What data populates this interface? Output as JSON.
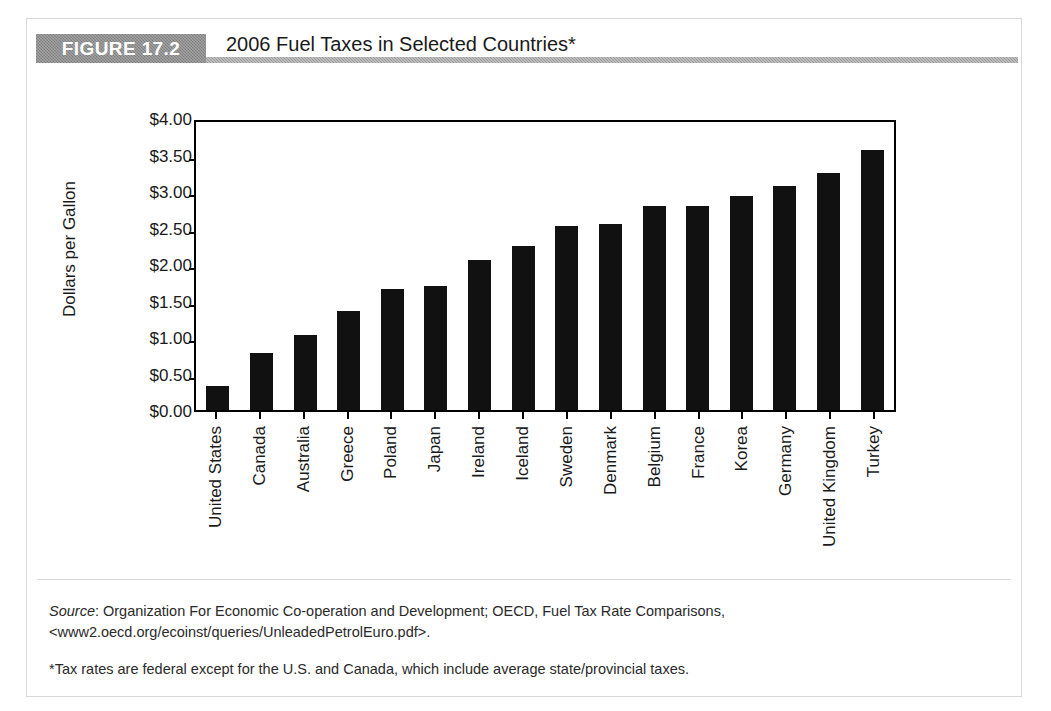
{
  "figure": {
    "badge_label": "FIGURE 17.2",
    "title": "2006 Fuel Taxes in Selected Countries*"
  },
  "notes": {
    "source_label": "Source",
    "source_text": ": Organization For Economic Co-operation and Development; OECD, Fuel Tax Rate Comparisons, <www2.oecd.org/ecoinst/queries/UnleadedPetrolEuro.pdf>.",
    "footnote": "*Tax rates are federal except for the U.S. and Canada, which include average state/provincial taxes."
  },
  "chart_data": {
    "type": "bar",
    "title": "2006 Fuel Taxes in Selected Countries*",
    "xlabel": "",
    "ylabel": "Dollars per Gallon",
    "ylim": [
      0,
      4.0
    ],
    "ytick_step": 0.5,
    "ytick_labels": [
      "$4.00",
      "$3.50",
      "$3.00",
      "$2.50",
      "$2.00",
      "$1.50",
      "$1.00",
      "$0.50",
      "$0.00"
    ],
    "ytick_values": [
      4.0,
      3.5,
      3.0,
      2.5,
      2.0,
      1.5,
      1.0,
      0.5,
      0.0
    ],
    "grid": false,
    "legend": false,
    "bar_color": "#111111",
    "categories": [
      "United States",
      "Canada",
      "Australia",
      "Greece",
      "Poland",
      "Japan",
      "Ireland",
      "Iceland",
      "Sweden",
      "Denmark",
      "Belgium",
      "France",
      "Korea",
      "Germany",
      "United Kingdom",
      "Turkey"
    ],
    "values": [
      0.33,
      0.78,
      1.03,
      1.36,
      1.66,
      1.7,
      2.06,
      2.25,
      2.52,
      2.55,
      2.79,
      2.79,
      2.93,
      3.07,
      3.25,
      3.56
    ],
    "series": [
      {
        "name": "Fuel tax (dollars per gallon)",
        "values": [
          0.33,
          0.78,
          1.03,
          1.36,
          1.66,
          1.7,
          2.06,
          2.25,
          2.52,
          2.55,
          2.79,
          2.79,
          2.93,
          3.07,
          3.25,
          3.56
        ]
      }
    ]
  }
}
